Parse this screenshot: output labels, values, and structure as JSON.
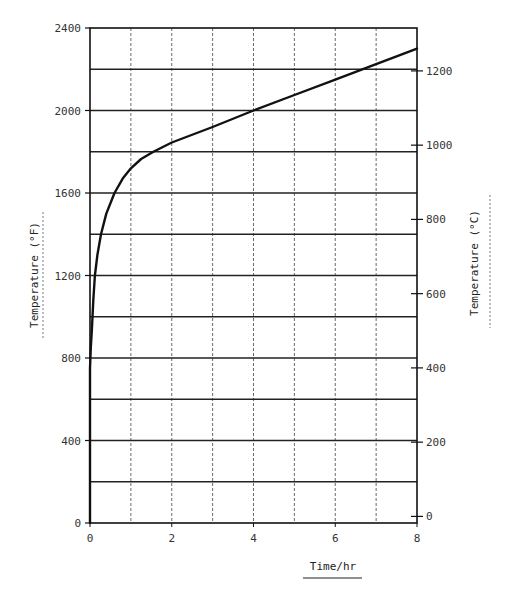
{
  "chart_data": {
    "type": "line",
    "title": "",
    "xlabel": "Time/hr",
    "ylabel": "Temperature (°F)",
    "ylabel_right": "Temperature (°C)",
    "xlim": [
      0,
      8
    ],
    "ylim": [
      0,
      2400
    ],
    "ylim_right_celsius": [
      -17.8,
      1315.6
    ],
    "grid": true,
    "x_ticks": [
      0,
      2,
      4,
      6,
      8
    ],
    "x_gridlines": [
      1,
      2,
      3,
      4,
      5,
      6,
      7
    ],
    "y_ticks": [
      0,
      400,
      800,
      1200,
      1600,
      2000,
      2400
    ],
    "y_gridlines": [
      200,
      400,
      600,
      800,
      1000,
      1200,
      1400,
      1600,
      1800,
      2000,
      2200
    ],
    "y_right_ticks": [
      0,
      200,
      400,
      600,
      800,
      1000,
      1200
    ],
    "series": [
      {
        "name": "Temperature",
        "x": [
          0,
          0.02,
          0.05,
          0.08,
          0.12,
          0.18,
          0.27,
          0.4,
          0.6,
          0.8,
          1.0,
          1.25,
          1.55,
          2.0,
          3.0,
          4.0,
          5.0,
          6.0,
          7.0,
          8.0
        ],
        "values": [
          750,
          850,
          950,
          1080,
          1200,
          1300,
          1400,
          1500,
          1600,
          1670,
          1720,
          1765,
          1800,
          1845,
          1920,
          2000,
          2075,
          2150,
          2225,
          2300
        ]
      }
    ],
    "legend": null
  },
  "plot": {
    "left": 90,
    "right": 417,
    "top": 28,
    "bottom": 523,
    "line_color": "#111111",
    "grid_color": "#444444"
  }
}
